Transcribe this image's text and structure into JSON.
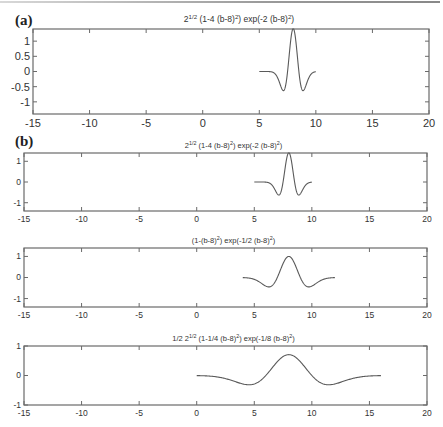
{
  "figure": {
    "panel_labels": [
      "(a)",
      "(b)"
    ],
    "axis_color": "#6a6a6a",
    "line_color": "#5a5a5a"
  },
  "chart_data": [
    {
      "type": "line",
      "panel": "(a)",
      "title": "2^{1/2} (1-4 (b-8)^2) exp(-2 (b-8)^2)",
      "title_parts": {
        "base": "2",
        "sup1": "1/2",
        "mid": " (1-4 (b-8)",
        "sup2": "2",
        "mid2": ") exp(-2 (b-8)",
        "sup3": "2",
        "end": ")"
      },
      "xlim": [
        -15,
        20
      ],
      "ylim": [
        -1.4,
        1.4
      ],
      "xticks": [
        -15,
        -10,
        -5,
        0,
        5,
        10,
        15,
        20
      ],
      "xtick_labels": [
        "-15",
        "-10",
        "-5",
        "0",
        "5",
        "10",
        "15",
        "20"
      ],
      "yticks": [
        1,
        0.5,
        0,
        -0.5,
        -1
      ],
      "ytick_labels": [
        "1",
        "0.5",
        "0",
        "-0.5",
        "-1"
      ],
      "x_range": [
        5,
        10
      ],
      "formula": {
        "a": 1.41421,
        "k": 4,
        "c": 2,
        "center": 8
      },
      "peak": {
        "x": 8,
        "y": 1.414
      },
      "minima": [
        {
          "x": 7.3,
          "y": -0.63
        },
        {
          "x": 8.7,
          "y": -0.63
        }
      ],
      "grid": false
    },
    {
      "type": "line",
      "panel": "(b) top",
      "title": "2^{1/2} (1-4 (b-8)^2) exp(-2 (b-8)^2)",
      "title_parts": {
        "base": "2",
        "sup1": "1/2",
        "mid": " (1-4 (b-8)",
        "sup2": "2",
        "mid2": ") exp(-2 (b-8)",
        "sup3": "2",
        "end": ")"
      },
      "xlim": [
        -15,
        20
      ],
      "ylim": [
        -1.4,
        1.4
      ],
      "xticks": [
        -15,
        -10,
        -5,
        0,
        5,
        10,
        15,
        20
      ],
      "xtick_labels": [
        "-15",
        "-10",
        "-5",
        "0",
        "5",
        "10",
        "15",
        "20"
      ],
      "yticks": [
        1,
        0,
        -1
      ],
      "ytick_labels": [
        "1",
        "0",
        "-1"
      ],
      "x_range": [
        5,
        10
      ],
      "formula": {
        "a": 1.41421,
        "k": 4,
        "c": 2,
        "center": 8
      },
      "grid": false
    },
    {
      "type": "line",
      "panel": "(b) middle",
      "title": "(1-(b-8)^2) exp(-1/2 (b-8)^2)",
      "title_parts": {
        "base": "(1-(b-8)",
        "sup1": "2",
        "mid": ") exp(-1/2 (b-8)",
        "sup2": "2",
        "mid2": ")",
        "sup3": "",
        "end": ""
      },
      "xlim": [
        -15,
        20
      ],
      "ylim": [
        -1.4,
        1.4
      ],
      "xticks": [
        -15,
        -10,
        -5,
        0,
        5,
        10,
        15,
        20
      ],
      "xtick_labels": [
        "-15",
        "-10",
        "-5",
        "0",
        "5",
        "10",
        "15",
        "20"
      ],
      "yticks": [
        1,
        0,
        -1
      ],
      "ytick_labels": [
        "1",
        "0",
        "-1"
      ],
      "x_range": [
        4,
        12
      ],
      "formula": {
        "a": 1.0,
        "k": 1,
        "c": 0.5,
        "center": 8
      },
      "peak": {
        "x": 8,
        "y": 1.0
      },
      "minima": [
        {
          "x": 6.27,
          "y": -0.45
        },
        {
          "x": 9.73,
          "y": -0.45
        }
      ],
      "grid": false
    },
    {
      "type": "line",
      "panel": "(b) bottom",
      "title": "1/2 2^{1/2} (1-1/4 (b-8)^2) exp(-1/8 (b-8)^2)",
      "title_parts": {
        "base": "1/2 2",
        "sup1": "1/2",
        "mid": " (1-1/4 (b-8)",
        "sup2": "2",
        "mid2": ") exp(-1/8 (b-8)",
        "sup3": "2",
        "end": ")"
      },
      "xlim": [
        -15,
        20
      ],
      "ylim": [
        -1,
        1
      ],
      "xticks": [
        -15,
        -10,
        -5,
        0,
        5,
        10,
        15,
        20
      ],
      "xtick_labels": [
        "-15",
        "-10",
        "-5",
        "0",
        "5",
        "10",
        "15",
        "20"
      ],
      "yticks": [
        1,
        0,
        -1
      ],
      "ytick_labels": [
        "1",
        "0",
        "-1"
      ],
      "x_range": [
        0,
        16
      ],
      "formula": {
        "a": 0.70711,
        "k": 0.25,
        "c": 0.125,
        "center": 8
      },
      "peak": {
        "x": 8,
        "y": 0.707
      },
      "minima": [
        {
          "x": 4.54,
          "y": -0.32
        },
        {
          "x": 11.46,
          "y": -0.32
        }
      ],
      "grid": false
    }
  ]
}
